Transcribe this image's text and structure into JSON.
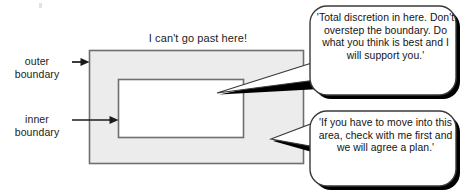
{
  "diagram": {
    "title_caption": "I can't go past here!",
    "labels": {
      "outer": "outer\nboundary",
      "inner": "inner\nboundary"
    },
    "regions": {
      "outer_band_fill": "#ececec",
      "inner_area_fill": "#ffffff",
      "stroke": "#6f6f6f"
    },
    "bubbles": [
      {
        "id": "discretion-bubble",
        "text": "'Total discretion in here. Don't overstep the boundary. Do what you think is best and I will support you.'",
        "fill": "#ffffff",
        "shadow": "#000000"
      },
      {
        "id": "check-first-bubble",
        "text": "'If you have to move into this area, check with me first and we will agree a plan.'",
        "fill": "#ffffff",
        "shadow": "#000000"
      }
    ],
    "arrows": [
      {
        "id": "outer-arrow",
        "points_to": "outer-boundary-rect"
      },
      {
        "id": "inner-arrow",
        "points_to": "inner-boundary-rect"
      }
    ]
  }
}
